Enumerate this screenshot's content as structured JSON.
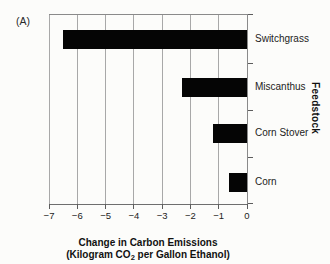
{
  "panel_label": "(A)",
  "colors": {
    "background": "#fcfcfa",
    "bar": "#050505",
    "gridline": "#a8a8a8",
    "frame": "#8a8a8a",
    "text": "#1c1c1c"
  },
  "chart_data": {
    "type": "bar",
    "orientation": "horizontal",
    "categories": [
      "Switchgrass",
      "Miscanthus",
      "Corn Stover",
      "Corn"
    ],
    "values": [
      -6.5,
      -2.3,
      -1.2,
      -0.65
    ],
    "title": "",
    "xlabel_line1": "Change in Carbon Emissions",
    "xlabel_line2_parts": {
      "pre": "(Kilogram CO",
      "sub": "2",
      "post": " per Gallon Ethanol)"
    },
    "ylabel": "Feedstock",
    "xlim": [
      -7,
      0
    ],
    "xticks": [
      "−7",
      "−6",
      "−5",
      "−4",
      "−3",
      "−2",
      "−1",
      "0"
    ],
    "grid": true,
    "legend": "none",
    "bar_color": "#050505"
  }
}
